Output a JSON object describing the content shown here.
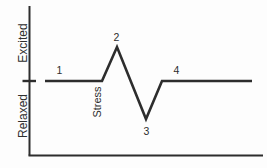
{
  "diagram": {
    "type": "stress-response-curve",
    "background": "#fdfdfd",
    "stroke_color": "#2d2d2d",
    "text_color": "#2e2e2e",
    "y_axis": {
      "top_label": "Excited",
      "bottom_label": "Relaxed"
    },
    "annotation": "Stress",
    "axes": {
      "x": 29.5,
      "y_top": 6,
      "y_bottom": 155.5,
      "x_right": 263,
      "stroke_width": 2
    },
    "baseline_tick": {
      "x1": 22.5,
      "x2": 36,
      "y": 81,
      "stroke_width": 2.4
    },
    "signal": {
      "stroke_width": 2.6,
      "points": [
        [
          45,
          81
        ],
        [
          102,
          81
        ],
        [
          117,
          47
        ],
        [
          146,
          119
        ],
        [
          162,
          81
        ],
        [
          252,
          81
        ]
      ]
    },
    "point_labels": [
      {
        "id": "point-label-1",
        "text": "1",
        "x": 59.5,
        "y": 74,
        "size": 10.5
      },
      {
        "id": "point-label-2",
        "text": "2",
        "x": 116.5,
        "y": 41,
        "size": 10.5
      },
      {
        "id": "point-label-3",
        "text": "3",
        "x": 146.5,
        "y": 134.5,
        "size": 10.5
      },
      {
        "id": "point-label-4",
        "text": "4",
        "x": 176.5,
        "y": 73.5,
        "size": 10.5
      }
    ],
    "rotated_labels": [
      {
        "id": "excited-axis-label",
        "text": "Excited",
        "x": 26.5,
        "y": 43,
        "size": 12,
        "rotate": -90
      },
      {
        "id": "relaxed-axis-label",
        "text": "Relaxed",
        "x": 26.5,
        "y": 116,
        "size": 12,
        "rotate": -90
      },
      {
        "id": "stress-annotation-label",
        "text": "Stress",
        "x": 100.5,
        "y": 102,
        "size": 11,
        "rotate": -90
      }
    ]
  }
}
